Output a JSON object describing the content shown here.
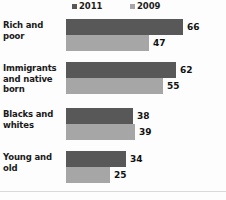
{
  "chart_data": {
    "type": "bar",
    "orientation": "horizontal",
    "title": "",
    "xlabel": "",
    "ylabel": "",
    "grid": false,
    "legend_position": "top",
    "xlim": [
      0,
      70
    ],
    "categories": [
      "Rich and poor",
      "Immigrants and native born",
      "Blacks and whites",
      "Young and old"
    ],
    "series": [
      {
        "name": "2011",
        "color": "#585858",
        "values": [
          66,
          62,
          38,
          34
        ]
      },
      {
        "name": "2009",
        "color": "#a6a6a6",
        "values": [
          47,
          55,
          39,
          25
        ]
      }
    ]
  },
  "legend": {
    "entries": [
      {
        "label": "2011",
        "swatch_color": "#585858"
      },
      {
        "label": "2009",
        "swatch_color": "#a6a6a6"
      }
    ]
  },
  "groups": [
    {
      "label": "Rich and poor",
      "bars": [
        {
          "series": "2011",
          "value": "66",
          "width_px": 117,
          "color": "#585858"
        },
        {
          "series": "2009",
          "value": "47",
          "width_px": 83,
          "color": "#a6a6a6"
        }
      ]
    },
    {
      "label": "Immigrants and native born",
      "bars": [
        {
          "series": "2011",
          "value": "62",
          "width_px": 110,
          "color": "#585858"
        },
        {
          "series": "2009",
          "value": "55",
          "width_px": 97,
          "color": "#a6a6a6"
        }
      ]
    },
    {
      "label": "Blacks and whites",
      "bars": [
        {
          "series": "2011",
          "value": "38",
          "width_px": 67,
          "color": "#585858"
        },
        {
          "series": "2009",
          "value": "39",
          "width_px": 69,
          "color": "#a6a6a6"
        }
      ]
    },
    {
      "label": "Young and old",
      "bars": [
        {
          "series": "2011",
          "value": "34",
          "width_px": 60,
          "color": "#585858"
        },
        {
          "series": "2009",
          "value": "25",
          "width_px": 44,
          "color": "#a6a6a6"
        }
      ]
    }
  ]
}
